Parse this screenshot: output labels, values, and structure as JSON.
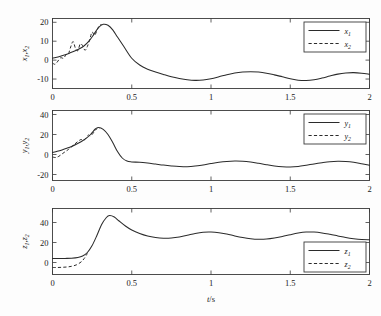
{
  "figure": {
    "xlabel": "t/s",
    "x_ticks": [
      "0",
      "0.5",
      "1",
      "1.5",
      "2"
    ],
    "x_tick_values": [
      0,
      0.5,
      1,
      1.5,
      2
    ],
    "xlim": [
      0,
      2
    ]
  },
  "panels": [
    {
      "id": "panel-x",
      "ylabel_base": "x",
      "ylabel": "x1, x2",
      "y_ticks": [
        "20",
        "10",
        "0",
        "-10"
      ],
      "y_tick_values": [
        20,
        10,
        0,
        -10
      ],
      "ylim": [
        -15,
        22
      ],
      "legend_position": "top-right",
      "legend": [
        {
          "label_base": "x",
          "label_sub": "1",
          "style": "solid"
        },
        {
          "label_base": "x",
          "label_sub": "2",
          "style": "dashed"
        }
      ]
    },
    {
      "id": "panel-y",
      "ylabel_base": "y",
      "ylabel": "y1, y2",
      "y_ticks": [
        "40",
        "20",
        "0",
        "-20"
      ],
      "y_tick_values": [
        40,
        20,
        0,
        -20
      ],
      "ylim": [
        -26,
        44
      ],
      "legend_position": "top-right",
      "legend": [
        {
          "label_base": "y",
          "label_sub": "1",
          "style": "solid"
        },
        {
          "label_base": "y",
          "label_sub": "2",
          "style": "dashed"
        }
      ]
    },
    {
      "id": "panel-z",
      "ylabel_base": "z",
      "ylabel": "z1, z2",
      "y_ticks": [
        "40",
        "20",
        "0"
      ],
      "y_tick_values": [
        40,
        20,
        0
      ],
      "ylim": [
        -12,
        54
      ],
      "legend_position": "bottom-right",
      "legend": [
        {
          "label_base": "z",
          "label_sub": "1",
          "style": "solid"
        },
        {
          "label_base": "z",
          "label_sub": "2",
          "style": "dashed"
        }
      ]
    }
  ],
  "chart_data": {
    "type": "line",
    "title": "",
    "xlabel": "t/s",
    "xlim": [
      0,
      2
    ],
    "grid": false,
    "subplots": [
      {
        "name": "panel-x",
        "ylabel": "x1, x2",
        "ylim": [
          -15,
          22
        ],
        "yticks": [
          -10,
          0,
          10,
          20
        ],
        "legend": [
          "x1",
          "x2"
        ],
        "legend_position": "top-right",
        "series": [
          {
            "name": "x1",
            "style": "solid",
            "x": [
              0,
              0.02,
              0.05,
              0.08,
              0.11,
              0.14,
              0.17,
              0.2,
              0.23,
              0.26,
              0.29,
              0.32,
              0.35,
              0.38,
              0.41,
              0.45,
              0.5,
              0.55,
              0.6,
              0.65,
              0.7,
              0.75,
              0.8,
              0.85,
              0.9,
              0.95,
              1.0,
              1.05,
              1.1,
              1.15,
              1.2,
              1.25,
              1.3,
              1.35,
              1.4,
              1.45,
              1.5,
              1.55,
              1.6,
              1.65,
              1.7,
              1.75,
              1.8,
              1.85,
              1.9,
              1.95,
              2.0
            ],
            "y": [
              1.0,
              1.4,
              2.1,
              2.9,
              3.8,
              4.8,
              6.0,
              7.6,
              10.0,
              13.5,
              17.2,
              18.9,
              18.4,
              16.0,
              12.2,
              7.2,
              1.0,
              -2.6,
              -4.8,
              -6.3,
              -7.6,
              -8.8,
              -9.7,
              -10.4,
              -10.7,
              -10.5,
              -9.8,
              -8.8,
              -7.7,
              -6.8,
              -6.3,
              -6.1,
              -6.3,
              -6.9,
              -7.8,
              -8.8,
              -9.8,
              -10.6,
              -10.8,
              -10.4,
              -9.5,
              -8.4,
              -7.4,
              -6.8,
              -6.6,
              -6.9,
              -7.5
            ]
          },
          {
            "name": "x2",
            "style": "dashed",
            "x": [
              0,
              0.015,
              0.03,
              0.05,
              0.07,
              0.085,
              0.1,
              0.115,
              0.13,
              0.145,
              0.16,
              0.175,
              0.19,
              0.205,
              0.22,
              0.235,
              0.25,
              0.265,
              0.28,
              0.295,
              0.31
            ],
            "y": [
              -1.5,
              -2.2,
              -1.0,
              1.2,
              1.0,
              2.8,
              3.2,
              7.0,
              9.8,
              6.2,
              5.0,
              8.6,
              7.6,
              5.2,
              7.2,
              11.0,
              14.8,
              13.0,
              15.6,
              18.2,
              18.8
            ]
          }
        ]
      },
      {
        "name": "panel-y",
        "ylabel": "y1, y2",
        "ylim": [
          -26,
          44
        ],
        "yticks": [
          -20,
          0,
          20,
          40
        ],
        "legend": [
          "y1",
          "y2"
        ],
        "legend_position": "top-right",
        "series": [
          {
            "name": "y1",
            "style": "solid",
            "x": [
              0,
              0.03,
              0.06,
              0.09,
              0.12,
              0.15,
              0.18,
              0.21,
              0.24,
              0.27,
              0.29,
              0.32,
              0.35,
              0.38,
              0.41,
              0.44,
              0.47,
              0.5,
              0.55,
              0.6,
              0.65,
              0.7,
              0.75,
              0.8,
              0.85,
              0.9,
              0.95,
              1.0,
              1.05,
              1.1,
              1.15,
              1.2,
              1.25,
              1.3,
              1.35,
              1.4,
              1.45,
              1.5,
              1.55,
              1.6,
              1.65,
              1.7,
              1.75,
              1.8,
              1.85,
              1.9,
              1.95,
              2.0
            ],
            "y": [
              2.0,
              3.2,
              4.6,
              6.2,
              8.0,
              10.2,
              12.8,
              15.8,
              20.0,
              25.5,
              27.0,
              25.2,
              20.0,
              12.0,
              3.0,
              -3.5,
              -6.6,
              -7.4,
              -7.8,
              -8.6,
              -9.6,
              -10.6,
              -11.4,
              -12.0,
              -12.2,
              -11.6,
              -10.4,
              -9.0,
              -7.8,
              -7.0,
              -6.6,
              -6.8,
              -7.6,
              -8.8,
              -10.2,
              -11.4,
              -12.2,
              -12.5,
              -12.0,
              -10.8,
              -9.4,
              -8.2,
              -7.2,
              -6.8,
              -7.0,
              -7.8,
              -9.2,
              -10.8
            ]
          },
          {
            "name": "y2",
            "style": "dashed",
            "x": [
              0,
              0.02,
              0.04,
              0.06,
              0.08,
              0.1,
              0.12,
              0.14,
              0.16,
              0.18,
              0.195,
              0.21,
              0.225,
              0.24,
              0.255,
              0.27,
              0.285,
              0.3
            ],
            "y": [
              -2.5,
              -3.0,
              -1.8,
              0.5,
              2.8,
              5.0,
              7.6,
              10.4,
              13.0,
              15.0,
              14.0,
              16.2,
              19.4,
              18.6,
              21.0,
              24.2,
              26.4,
              26.0
            ]
          }
        ]
      },
      {
        "name": "panel-z",
        "ylabel": "z1, z2",
        "ylim": [
          -12,
          54
        ],
        "yticks": [
          0,
          20,
          40
        ],
        "legend": [
          "z1",
          "z2"
        ],
        "legend_position": "bottom-right",
        "series": [
          {
            "name": "z1",
            "style": "solid",
            "x": [
              0,
              0.04,
              0.08,
              0.12,
              0.16,
              0.19,
              0.22,
              0.25,
              0.28,
              0.31,
              0.34,
              0.36,
              0.39,
              0.42,
              0.46,
              0.5,
              0.55,
              0.6,
              0.65,
              0.7,
              0.75,
              0.8,
              0.85,
              0.9,
              0.95,
              1.0,
              1.05,
              1.1,
              1.15,
              1.2,
              1.25,
              1.3,
              1.35,
              1.4,
              1.45,
              1.5,
              1.55,
              1.6,
              1.65,
              1.7,
              1.75,
              1.8,
              1.85,
              1.9,
              1.95,
              2.0
            ],
            "y": [
              4.0,
              4.0,
              4.1,
              4.3,
              5.0,
              6.5,
              10.0,
              17.0,
              27.0,
              38.0,
              45.0,
              47.0,
              45.5,
              41.5,
              36.5,
              32.5,
              29.0,
              26.5,
              25.0,
              24.3,
              24.5,
              25.5,
              27.2,
              29.0,
              30.2,
              30.4,
              29.8,
              28.4,
              26.6,
              25.0,
              23.8,
              23.2,
              23.4,
              24.4,
              26.0,
              27.8,
              29.4,
              30.4,
              30.4,
              29.6,
              28.2,
              26.6,
              25.0,
              23.8,
              23.0,
              22.8
            ]
          },
          {
            "name": "z2",
            "style": "dashed",
            "x": [
              0,
              0.03,
              0.06,
              0.09,
              0.12,
              0.15,
              0.18,
              0.2,
              0.22
            ],
            "y": [
              -5.0,
              -5.0,
              -4.8,
              -4.5,
              -3.8,
              -2.4,
              0.5,
              4.0,
              9.0
            ]
          }
        ]
      }
    ]
  }
}
